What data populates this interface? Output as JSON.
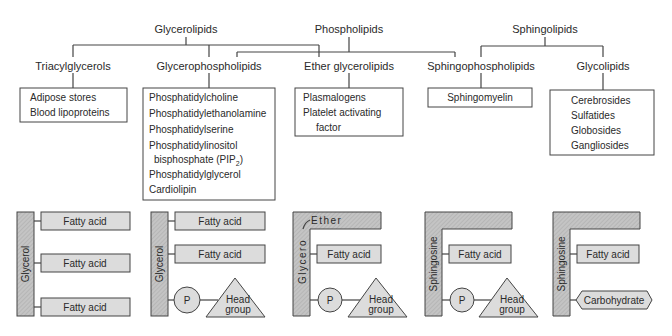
{
  "hierarchy": {
    "top": [
      "Glycerolipids",
      "Phospholipids",
      "Sphingolipids"
    ],
    "classes": [
      "Triacylglycerols",
      "Glycerophospholipids",
      "Ether glycerolipids",
      "Sphingophospholipids",
      "Glycolipids"
    ],
    "examples": {
      "triacylglycerols": [
        "Adipose stores",
        "Blood lipoproteins"
      ],
      "glycerophospholipids": [
        "Phosphatidylcholine",
        "Phosphatidylethanolamine",
        "Phosphatidylserine",
        "Phosphatidylinositol",
        "bisphosphate (PIP",
        "2",
        ")",
        "Phosphatidylglycerol",
        "Cardiolipin"
      ],
      "ether_glycerolipids": [
        "Plasmalogens",
        "Platelet activating",
        "factor"
      ],
      "sphingophospholipids": [
        "Sphingomyelin"
      ],
      "glycolipids": [
        "Cerebrosides",
        "Sulfatides",
        "Globosides",
        "Gangliosides"
      ]
    }
  },
  "structures": {
    "glycerol": "Glycerol",
    "glycero": "Glycero",
    "ether": "Ether",
    "sphingosine": "Sphingosine",
    "fatty_acid": "Fatty acid",
    "phosphate": "P",
    "head_group_1": "Head",
    "head_group_2": "group",
    "carbohydrate": "Carbohydrate"
  }
}
